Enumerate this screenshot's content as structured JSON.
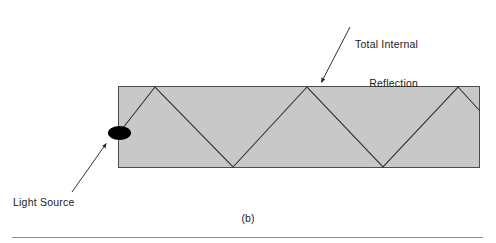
{
  "figure": {
    "caption": "(b)",
    "labels": {
      "total_internal_reflection_line1": "Total Internal",
      "total_internal_reflection_line2": "Reflection",
      "light_source": "Light Source"
    },
    "colors": {
      "slab_fill": "#c8c8c8",
      "slab_border": "#4d4d4d",
      "ray": "#333333",
      "light_source": "#000000",
      "text": "#1a1a1a",
      "rule": "#8c8c8c",
      "background": "#ffffff"
    }
  },
  "chart_data": {
    "type": "diagram",
    "subtitle": "(b)",
    "xlabel": "",
    "ylabel": "",
    "slab": {
      "name": "optical-slab",
      "x": 118,
      "y": 86,
      "width": 362,
      "height": 82,
      "fill": "#c8c8c8",
      "stroke": "#4d4d4d"
    },
    "light_source": {
      "name": "light-source-ellipse",
      "cx": 119.5,
      "cy": 133,
      "rx": 11.5,
      "ry": 7,
      "fill": "#000000"
    },
    "ray_path": {
      "name": "zigzag-light-ray",
      "points": [
        [
          119,
          133
        ],
        [
          155,
          87
        ],
        [
          233,
          167
        ],
        [
          307,
          87
        ],
        [
          383,
          167
        ],
        [
          458,
          87
        ],
        [
          480,
          111
        ]
      ],
      "stroke": "#333333",
      "stroke_width": 1.1
    },
    "reflection_points_top": [
      [
        155,
        87
      ],
      [
        307,
        87
      ],
      [
        458,
        87
      ]
    ],
    "reflection_points_bottom": [
      [
        233,
        167
      ],
      [
        383,
        167
      ]
    ],
    "annotations": [
      {
        "name": "total-internal-reflection-annotation",
        "text": "Total Internal Reflection",
        "text_x": 355,
        "text_y": 12,
        "arrow_from": [
          350,
          27
        ],
        "arrow_to": [
          320,
          85
        ]
      },
      {
        "name": "light-source-annotation",
        "text": "Light Source",
        "text_x": 13,
        "text_y": 196,
        "arrow_from": [
          72,
          192
        ],
        "arrow_to": [
          108,
          141
        ]
      }
    ],
    "rule": {
      "name": "bottom-rule",
      "x1": 12,
      "y1": 237,
      "x2": 483,
      "y2": 237,
      "stroke": "#8c8c8c"
    },
    "grid": false,
    "legend": "none"
  }
}
